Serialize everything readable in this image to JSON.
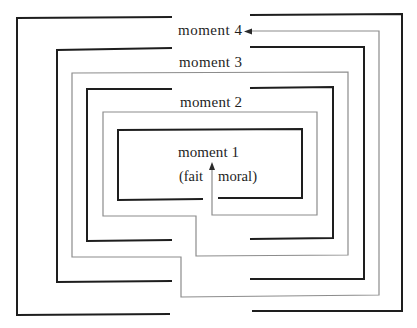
{
  "diagram": {
    "moments": [
      {
        "label": "moment 4"
      },
      {
        "label": "moment 3"
      },
      {
        "label": "moment 2"
      },
      {
        "label": "moment 1"
      }
    ],
    "annotation": {
      "left": "(fait",
      "right": "moral)"
    },
    "colors": {
      "walls": "#1e1e1e",
      "path": "#8c8c8c",
      "background": "#ffffff"
    }
  }
}
